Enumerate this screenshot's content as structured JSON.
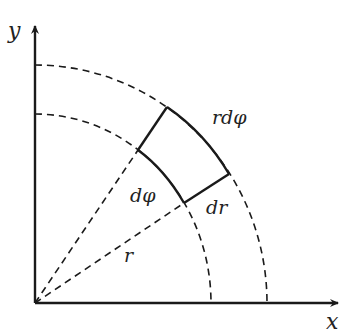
{
  "diagram": {
    "axes": {
      "x_label": "x",
      "y_label": "y"
    },
    "labels": {
      "arc_length": "rdφ",
      "angle": "dφ",
      "radial_width": "dr",
      "radius": "r"
    },
    "colors": {
      "stroke": "#1a1a1a",
      "background": "#ffffff"
    }
  }
}
